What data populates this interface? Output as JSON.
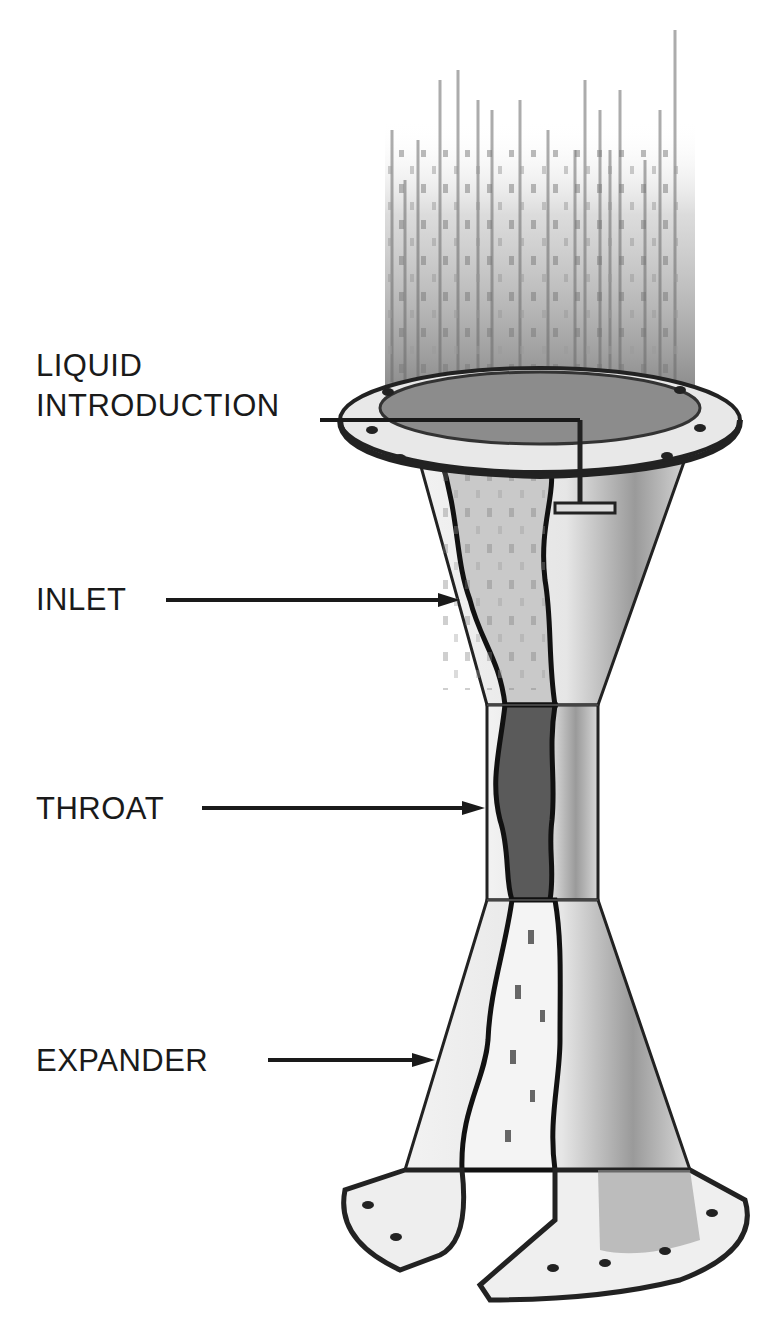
{
  "diagram": {
    "labels": [
      {
        "id": "liquid-introduction",
        "lines": [
          "LIQUID",
          "INTRODUCTION"
        ]
      },
      {
        "id": "inlet",
        "lines": [
          "INLET"
        ]
      },
      {
        "id": "throat",
        "lines": [
          "THROAT"
        ]
      },
      {
        "id": "expander",
        "lines": [
          "EXPANDER"
        ]
      }
    ],
    "colors": {
      "ink": "#1a1a1a",
      "background": "#ffffff",
      "shade": "#8a8a8a"
    }
  }
}
